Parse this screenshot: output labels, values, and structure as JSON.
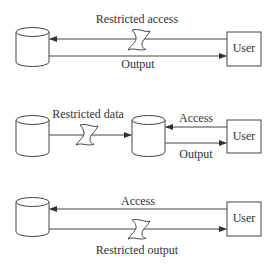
{
  "diagram": {
    "scenario1": {
      "restricted_label": "Restricted access",
      "output_label": "Output",
      "user_label": "User"
    },
    "scenario2": {
      "restricted_label": "Restricted data",
      "access_label": "Access",
      "output_label": "Output",
      "user_label": "User"
    },
    "scenario3": {
      "access_label": "Access",
      "restricted_label": "Restricted output",
      "user_label": "User"
    },
    "colors": {
      "stroke": "#444444",
      "text": "#333333",
      "background": "#ffffff"
    }
  }
}
